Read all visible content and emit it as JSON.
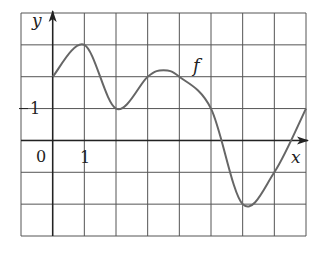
{
  "chart_data": {
    "type": "line",
    "title": "",
    "xlabel": "x",
    "ylabel": "y",
    "curve_label": "f",
    "grid": true,
    "xlim": [
      -1,
      8
    ],
    "ylim": [
      -3,
      4
    ],
    "tick_labels": {
      "origin": "0",
      "x_one": "1",
      "y_one": "1"
    },
    "series": [
      {
        "name": "f",
        "x": [
          0,
          1,
          2,
          3,
          3.5,
          4,
          5,
          6,
          7,
          8
        ],
        "y": [
          2,
          3,
          1,
          2,
          2.2,
          2,
          1,
          -2,
          -1,
          1
        ]
      }
    ],
    "colors": {
      "grid": "#555555",
      "curve": "#666666",
      "axis": "#222222"
    }
  }
}
